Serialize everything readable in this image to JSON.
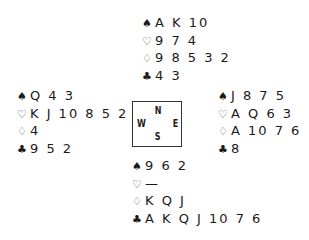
{
  "suit_symbols": {
    "spades": "♠",
    "hearts": "♡",
    "diamonds": "♢",
    "clubs": "♣"
  },
  "north": {
    "spades": "A K 10",
    "hearts": "9 7 4",
    "diamonds": "9 8 5 3 2",
    "clubs": "4 3"
  },
  "west": {
    "spades": "Q 4 3",
    "hearts": "K J 10 8 5 2",
    "diamonds": "4",
    "clubs": "9 5 2"
  },
  "east": {
    "spades": "J 8 7 5",
    "hearts": "A Q 6 3",
    "diamonds": "A 10 7 6",
    "clubs": "8"
  },
  "south": {
    "spades": "9 6 2",
    "hearts": "—",
    "diamonds": "K Q J",
    "clubs": "A K Q J 10 7 6"
  },
  "compass": {
    "n": "N",
    "s": "S",
    "w": "W",
    "e": "E"
  }
}
